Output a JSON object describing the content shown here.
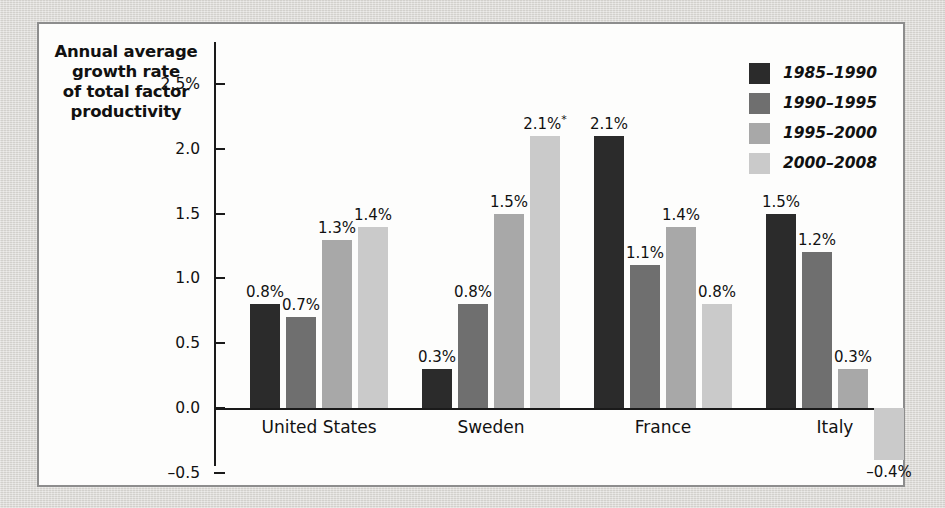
{
  "figure": {
    "axis_title": "Annual average growth rate of total factor productivity",
    "axis_title_lines": [
      "Annual average",
      "growth rate",
      "of total factor",
      "productivity"
    ]
  },
  "colors": {
    "series": [
      "#2b2b2b",
      "#6f6f6f",
      "#a8a8a8",
      "#cacaca"
    ],
    "axis": "#1a1a1a",
    "panel_background": "#fdfdfc",
    "panel_border": "#8d8d8d",
    "page_background": "#d9d7d3",
    "text": "#111111"
  },
  "legend": {
    "position": "top-right",
    "entries": [
      {
        "label": "1985–1990",
        "color": "#2b2b2b"
      },
      {
        "label": "1990–1995",
        "color": "#6f6f6f"
      },
      {
        "label": "1995–2000",
        "color": "#a8a8a8"
      },
      {
        "label": "2000–2008",
        "color": "#cacaca"
      }
    ]
  },
  "chart_data": {
    "type": "bar",
    "title": "",
    "subtitle": "",
    "xlabel": "",
    "ylabel": "Annual average growth rate of total factor productivity",
    "ylim": [
      -0.5,
      2.5
    ],
    "yticks": [
      2.5,
      2.0,
      1.5,
      1.0,
      0.5,
      0.0,
      -0.5
    ],
    "ytick_labels": [
      "2.5%",
      "2.0",
      "1.5",
      "1.0",
      "0.5",
      "0.0",
      "–0.5"
    ],
    "grid": false,
    "legend_position": "top right",
    "categories": [
      "United States",
      "Sweden",
      "France",
      "Italy"
    ],
    "series": [
      {
        "name": "1985–1990",
        "color": "#2b2b2b",
        "values": [
          0.8,
          0.3,
          2.1,
          1.5
        ],
        "labels": [
          "0.8%",
          "0.3%",
          "2.1%",
          "1.5%"
        ]
      },
      {
        "name": "1990–1995",
        "color": "#6f6f6f",
        "values": [
          0.7,
          0.8,
          1.1,
          1.2
        ],
        "labels": [
          "0.7%",
          "0.8%",
          "1.1%",
          "1.2%"
        ]
      },
      {
        "name": "1995–2000",
        "color": "#a8a8a8",
        "values": [
          1.3,
          1.5,
          1.4,
          0.3
        ],
        "labels": [
          "1.3%",
          "1.5%",
          "1.4%",
          "0.3%"
        ]
      },
      {
        "name": "2000–2008",
        "color": "#cacaca",
        "values": [
          1.4,
          2.1,
          0.8,
          -0.4
        ],
        "labels": [
          "1.4%",
          "2.1%*",
          "0.8%",
          "–0.4%"
        ]
      }
    ],
    "annotations": [
      {
        "text": "*",
        "attached_to": "Sweden / 2000–2008",
        "note": "asterisk footnote marker on the 2.1% label"
      }
    ]
  }
}
